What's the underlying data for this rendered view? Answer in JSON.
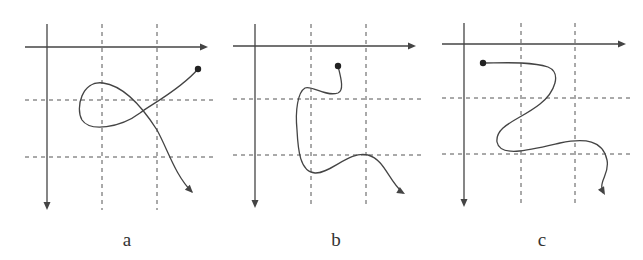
{
  "figure": {
    "colors": {
      "line": "#444444",
      "grid": "#555555",
      "background": "#ffffff"
    },
    "panels": [
      {
        "id": "a",
        "label": "a",
        "label_pos": [
          127,
          245
        ],
        "axis_origin": [
          47,
          47
        ],
        "x_axis_end": 208,
        "y_axis_end": 210,
        "y_axis_top": 24,
        "x_axis_left": 25,
        "grid_x": [
          102,
          157
        ],
        "grid_y": [
          100,
          157
        ],
        "grid_extent": {
          "x_from": 25,
          "x_to": 215,
          "y_from": 24,
          "y_to": 210
        },
        "start_dot": [
          198,
          69
        ],
        "path": "M198,69 C180,90 150,105 140,113 C120,128 90,132 82,120 C75,108 82,80 103,83 C125,86 143,108 157,130 C168,150 175,175 192,192",
        "arrow_tip": [
          193,
          193
        ],
        "arrow_angle": 45
      },
      {
        "id": "b",
        "label": "b",
        "label_pos": [
          336,
          245
        ],
        "axis_origin": [
          255,
          46
        ],
        "x_axis_end": 416,
        "y_axis_end": 208,
        "y_axis_top": 24,
        "x_axis_left": 233,
        "grid_x": [
          311,
          366
        ],
        "grid_y": [
          99,
          155
        ],
        "grid_extent": {
          "x_from": 233,
          "x_to": 422,
          "y_from": 24,
          "y_to": 208
        },
        "start_dot": [
          338,
          66
        ],
        "path": "M338,66 C340,75 345,90 338,93 C325,97 312,85 305,88 C298,92 295,110 297,130 C298,150 300,172 315,173 C330,174 350,150 368,155 C385,160 388,180 403,193",
        "arrow_tip": [
          405,
          194
        ],
        "arrow_angle": 30
      },
      {
        "id": "c",
        "label": "c",
        "label_pos": [
          542,
          245
        ],
        "axis_origin": [
          464,
          44
        ],
        "x_axis_end": 626,
        "y_axis_end": 207,
        "y_axis_top": 23,
        "x_axis_left": 442,
        "grid_x": [
          521,
          575
        ],
        "grid_y": [
          98,
          154
        ],
        "grid_extent": {
          "x_from": 442,
          "x_to": 632,
          "y_from": 23,
          "y_to": 207
        },
        "start_dot": [
          483,
          63
        ],
        "path": "M483,63 C500,63 530,61 548,67 C562,73 555,92 540,104 C520,120 495,125 497,142 C500,158 530,150 560,143 C585,138 603,140 607,160 C610,175 598,180 603,193",
        "arrow_tip": [
          605,
          195
        ],
        "arrow_angle": 60
      }
    ]
  }
}
